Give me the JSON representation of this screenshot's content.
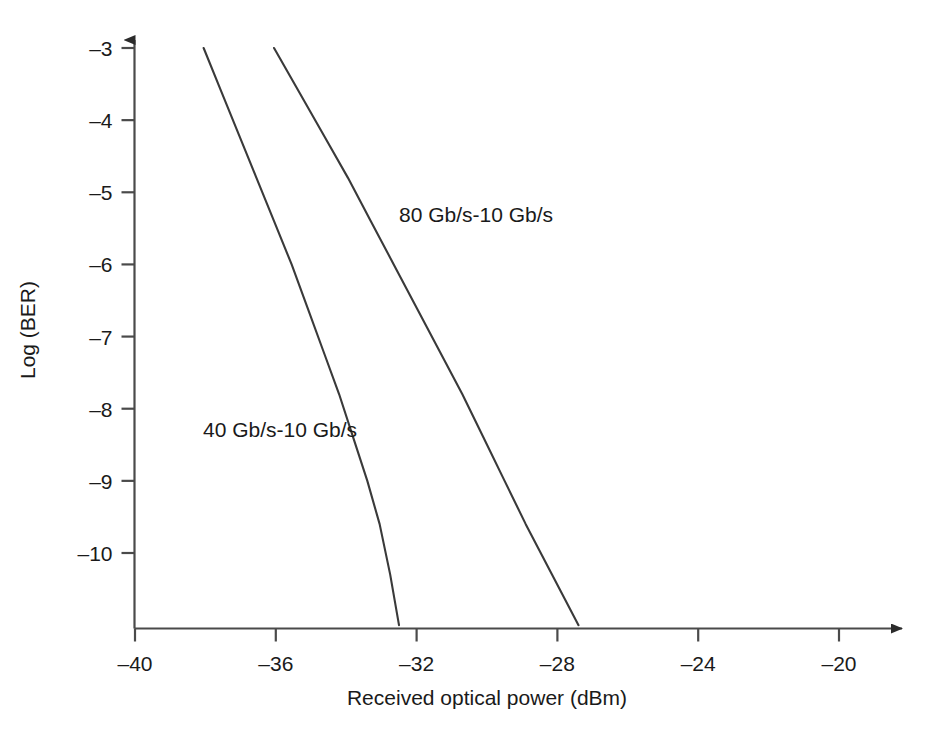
{
  "chart_data": {
    "type": "line",
    "title": "",
    "xlabel": "Received optical power (dBm)",
    "ylabel": "Log (BER)",
    "xlim": [
      -40,
      -18
    ],
    "ylim": [
      -11,
      -3
    ],
    "grid": false,
    "legend_position": "inline-annotations",
    "xticks": [
      -40,
      -36,
      -32,
      -28,
      -24,
      -20
    ],
    "xtick_labels": [
      "–40",
      "–36",
      "–32",
      "–28",
      "–24",
      "–20"
    ],
    "yticks": [
      -3,
      -4,
      -5,
      -6,
      -7,
      -8,
      -9,
      -10
    ],
    "ytick_labels": [
      "–3",
      "–4",
      "–5",
      "–6",
      "–7",
      "–8",
      "–9",
      "–10"
    ],
    "axis_style": "arrowed-open-L",
    "line_color": "#3a3a3a",
    "series": [
      {
        "name": "40 Gb/s-10 Gb/s",
        "label": "40 Gb/s-10 Gb/s",
        "x": [
          -38.05,
          -37.55,
          -37.05,
          -36.55,
          -36.05,
          -35.55,
          -35.1,
          -34.65,
          -34.2,
          -33.8,
          -33.4,
          -33.05,
          -32.75,
          -32.5
        ],
        "y": [
          -3.0,
          -3.6,
          -4.2,
          -4.8,
          -5.4,
          -6.0,
          -6.6,
          -7.2,
          -7.8,
          -8.4,
          -9.0,
          -9.6,
          -10.3,
          -11.0
        ]
      },
      {
        "name": "80 Gb/s-10 Gb/s",
        "label": "80 Gb/s-10 Gb/s",
        "x": [
          -36.05,
          -35.35,
          -34.65,
          -33.95,
          -33.3,
          -32.65,
          -32.0,
          -31.35,
          -30.7,
          -30.1,
          -29.5,
          -28.9,
          -28.15,
          -27.4
        ],
        "y": [
          -3.0,
          -3.6,
          -4.2,
          -4.8,
          -5.4,
          -6.0,
          -6.6,
          -7.2,
          -7.8,
          -8.4,
          -9.0,
          -9.6,
          -10.3,
          -11.0
        ]
      }
    ]
  }
}
